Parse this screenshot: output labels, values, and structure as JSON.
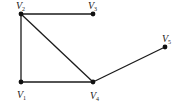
{
  "diagram": {
    "type": "undirected-graph",
    "colors": {
      "edge": "#1a1a1a",
      "node": "#111111",
      "background": "#ffffff"
    },
    "nodes": [
      {
        "id": "V1",
        "label": "V",
        "sub": "1",
        "x": 21,
        "y": 82,
        "lx": 17,
        "ly": 98
      },
      {
        "id": "V2",
        "label": "V",
        "sub": "2",
        "x": 21,
        "y": 14,
        "lx": 16,
        "ly": 9
      },
      {
        "id": "V3",
        "label": "V",
        "sub": "3",
        "x": 93,
        "y": 14,
        "lx": 88,
        "ly": 9
      },
      {
        "id": "V4",
        "label": "V",
        "sub": "4",
        "x": 93,
        "y": 82,
        "lx": 90,
        "ly": 99
      },
      {
        "id": "V5",
        "label": "V",
        "sub": "5",
        "x": 165,
        "y": 47,
        "lx": 162,
        "ly": 42
      }
    ],
    "edges": [
      {
        "from": "V2",
        "to": "V3"
      },
      {
        "from": "V2",
        "to": "V1"
      },
      {
        "from": "V2",
        "to": "V4"
      },
      {
        "from": "V1",
        "to": "V4"
      },
      {
        "from": "V4",
        "to": "V5"
      }
    ]
  }
}
